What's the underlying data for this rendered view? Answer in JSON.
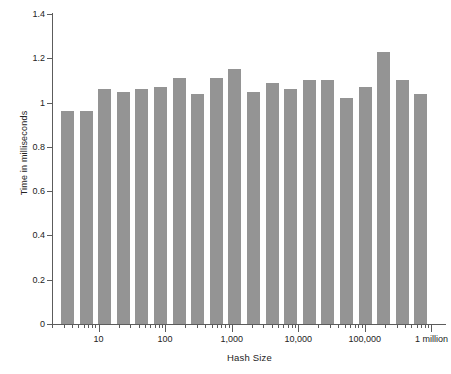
{
  "chart_data": {
    "type": "bar",
    "title": "",
    "xlabel": "Hash Size",
    "ylabel": "Time in milliseconds",
    "xscale": "log",
    "xlim": [
      2,
      1600000
    ],
    "ylim": [
      0,
      1.4
    ],
    "grid": false,
    "legend": null,
    "bar_color": "#949494",
    "axis_color": "#5c5c5c",
    "y_ticks": [
      0,
      0.2,
      0.4,
      0.6,
      0.8,
      1.0,
      1.2,
      1.4
    ],
    "y_tick_labels": [
      "0",
      "0.2",
      "0.4",
      "0.6",
      "0.8",
      "1",
      "1.2",
      "1.4"
    ],
    "x_tick_values": [
      10,
      100,
      1000,
      10000,
      100000,
      1000000
    ],
    "x_tick_labels": [
      "10",
      "100",
      "1,000",
      "10,000",
      "100,000",
      "1 million"
    ],
    "categories": [
      3,
      5,
      8,
      13,
      21,
      34,
      55,
      89,
      144,
      233,
      377,
      610,
      987,
      1597,
      2584,
      4181,
      6765,
      10946,
      17711,
      28657
    ],
    "values": [
      0.96,
      0.96,
      1.06,
      1.05,
      1.06,
      1.07,
      1.11,
      1.04,
      1.11,
      1.15,
      1.05,
      1.09,
      1.06,
      1.1,
      1.1,
      1.02,
      1.07,
      1.23,
      1.1,
      1.04
    ],
    "n_bars": 20
  },
  "axis": {
    "ylabel": "Time in milliseconds",
    "xlabel": "Hash Size"
  }
}
